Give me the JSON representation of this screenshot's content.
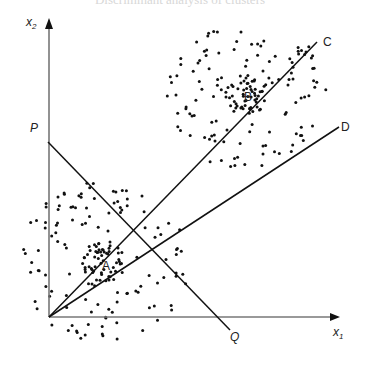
{
  "title": "Discriminant analysis of clusters",
  "axes": {
    "x_label_base": "x",
    "x_label_sub": "1",
    "y_label_base": "x",
    "y_label_sub": "2",
    "origin": [
      49,
      317
    ],
    "x_end": [
      340,
      317
    ],
    "y_end": [
      49,
      18
    ],
    "color": "#777777"
  },
  "lines": [
    {
      "id": "PQ",
      "from": [
        48,
        142
      ],
      "to": [
        230,
        330
      ],
      "start_label": "P",
      "end_label": "Q"
    },
    {
      "id": "OC",
      "from": [
        49,
        317
      ],
      "to": [
        317,
        42
      ],
      "end_label": "C"
    },
    {
      "id": "OD",
      "from": [
        49,
        317
      ],
      "to": [
        339,
        127
      ],
      "end_label": "D"
    }
  ],
  "labels": {
    "P": {
      "text": "P",
      "x": 30,
      "y": 122,
      "italic": true
    },
    "Q": {
      "text": "Q",
      "x": 230,
      "y": 331,
      "italic": true
    },
    "C": {
      "text": "C",
      "x": 323,
      "y": 36,
      "italic": false
    },
    "D": {
      "text": "D",
      "x": 341,
      "y": 121,
      "italic": false
    },
    "A": {
      "text": "A",
      "x": 102,
      "y": 260,
      "italic": false
    },
    "B": {
      "text": "B",
      "x": 244,
      "y": 91,
      "italic": false
    }
  },
  "clusters": [
    {
      "name": "A",
      "center": [
        104,
        262
      ],
      "dense_radius": 22,
      "sparse_radius": 85,
      "dense_count": 60,
      "sparse_count": 120
    },
    {
      "name": "B",
      "center": [
        247,
        95
      ],
      "dense_radius": 22,
      "sparse_radius": 80,
      "dense_count": 60,
      "sparse_count": 120
    }
  ],
  "colors": {
    "ink": "#111111",
    "axis": "#777777",
    "background": "#ffffff"
  }
}
